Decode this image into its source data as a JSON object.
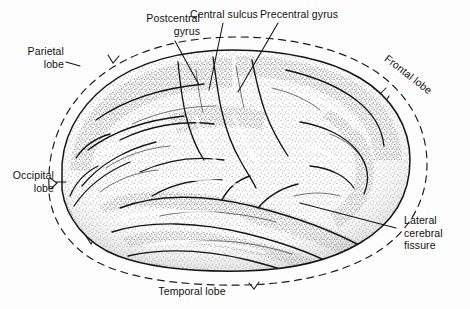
{
  "figure": {
    "type": "anatomical-illustration",
    "style": "stippled pen-and-ink line drawing",
    "background_color": "#fdfdfd",
    "ink_color": "#1a1a1a"
  },
  "labels": {
    "postcentral_gyrus": "Postcentral\ngyrus",
    "central_sulcus": "Central sulcus",
    "precentral_gyrus": "Precentral gyrus",
    "parietal_lobe": "Parietal\nlobe",
    "frontal_lobe": "Frontal lobe",
    "occipital_lobe": "Occipital\nlobe",
    "lateral_cerebral_fissure": "Lateral\ncerebral\nfissure",
    "temporal_lobe": "Temporal lobe"
  },
  "annotations": {
    "lobe_boundaries": "dashed",
    "leader_lines": "solid thin"
  }
}
